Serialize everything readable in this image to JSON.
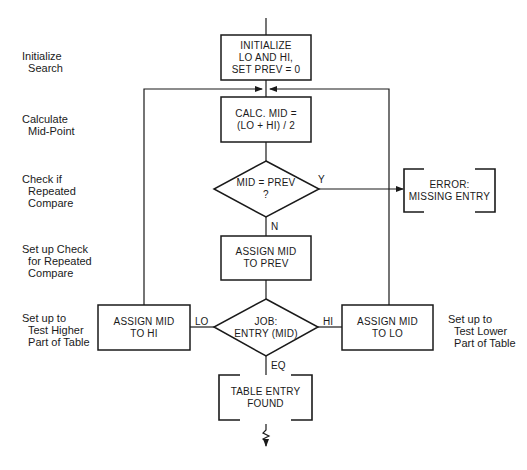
{
  "diagram": {
    "type": "flowchart",
    "side_labels": {
      "initialize": "Initialize\n  Search",
      "calculate": "Calculate\n  Mid-Point",
      "check": "Check if\n  Repeated\n  Compare",
      "setup_check": "Set up Check\n  for Repeated\n  Compare",
      "setup_higher": "Set up to\n  Test Higher\n  Part of Table",
      "setup_lower": "Set up to\n  Test Lower\n  Part of Table"
    },
    "nodes": {
      "init": "INITIALIZE\nLO AND HI,\nSET PREV = 0",
      "calc": "CALC. MID =\n(LO + HI) / 2",
      "check_prev": "MID = PREV\n?",
      "assign_prev": "ASSIGN MID\nTO PREV",
      "compare": "JOB:\nENTRY (MID)",
      "assign_hi": "ASSIGN MID\nTO HI",
      "assign_lo": "ASSIGN MID\nTO LO",
      "error": "ERROR:\nMISSING ENTRY",
      "found": "TABLE ENTRY\nFOUND"
    },
    "edge_labels": {
      "yes": "Y",
      "no": "N",
      "lo": "LO",
      "hi": "HI",
      "eq": "EQ"
    },
    "colors": {
      "line": "#1a1a1a",
      "background": "#ffffff"
    }
  }
}
